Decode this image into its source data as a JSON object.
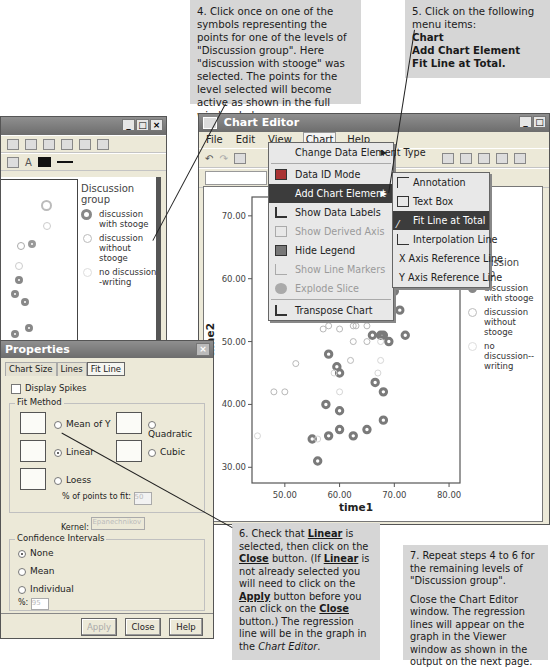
{
  "notes": {
    "step4": "4. Click once on one of the symbols representing the points for one of the levels of \"Discussion group\". Here \"discussion with stooge\" was selected. The points for the level selected will become active as shown in the full window below.",
    "step5_intro": "5. Click on the following menu items:",
    "step5_items": [
      "Chart",
      "Add Chart Element",
      "Fit Line at Total."
    ],
    "step6": {
      "p1": "6. Check that ",
      "linear": "Linear",
      "p2": " is selected, then click on the ",
      "close": "Close",
      "p3": " button. (If ",
      "linear2": "Linear",
      "p4": " is not already selected you will need to click on the ",
      "apply": "Apply",
      "p5": " button before you can click on the ",
      "close2": "Close",
      "p6": " button.) The regression line will be in the graph in the ",
      "editor": "Chart Editor",
      "p7": "."
    },
    "step7_a": "7. Repeat steps 4 to 6 for the remaining levels of \"Discussion group\".",
    "step7_b": "Close the Chart Editor window. The regression lines will appear on the graph in the Viewer window as shown in the output on the next page."
  },
  "bg_window": {
    "buttons": [
      "_",
      "□",
      "×"
    ],
    "legend_title": "Discussion group",
    "legend": [
      "discussion with stooge",
      "discussion without stooge",
      "no discussion--writing"
    ]
  },
  "chart_editor": {
    "title": "Chart Editor",
    "menu": [
      "File",
      "Edit",
      "View",
      "Chart",
      "Help"
    ],
    "active_menu": "Chart",
    "buttons": [
      "_",
      "□"
    ],
    "chart_menu": [
      {
        "label": "Change Data Element Type",
        "submenu": true,
        "state": "normal"
      },
      {
        "label": "Data ID Mode",
        "state": "normal"
      },
      {
        "label": "Add Chart Element",
        "submenu": true,
        "state": "selected"
      },
      {
        "label": "Show Data Labels",
        "state": "normal"
      },
      {
        "label": "Show Derived Axis",
        "state": "disabled"
      },
      {
        "label": "Hide Legend",
        "state": "normal"
      },
      {
        "label": "Show Line Markers",
        "state": "disabled"
      },
      {
        "label": "Explode Slice",
        "state": "disabled"
      },
      {
        "label": "Transpose Chart",
        "state": "normal"
      }
    ],
    "submenu": [
      {
        "label": "Annotation",
        "state": "normal"
      },
      {
        "label": "Text Box",
        "state": "normal"
      },
      {
        "label": "Fit Line at Total",
        "state": "selected"
      },
      {
        "label": "Interpolation Line",
        "state": "normal"
      },
      {
        "label": "X Axis Reference Line",
        "state": "normal"
      },
      {
        "label": "Y Axis Reference Line",
        "state": "normal"
      }
    ],
    "legend_title": "Discussion group",
    "legend": [
      "discussion with stooge",
      "discussion without stooge",
      "no discussion--writing"
    ]
  },
  "chart_data": {
    "type": "scatter",
    "title": "",
    "xlabel": "time1",
    "ylabel": "time2",
    "xlim": [
      44,
      82
    ],
    "ylim": [
      27.5,
      73
    ],
    "xticks": [
      "50.00",
      "60.00",
      "70.00",
      "80.00"
    ],
    "yticks": [
      "30.00",
      "40.00",
      "50.00",
      "60.00",
      "70.00"
    ],
    "legend_title": "Discussion group",
    "legend_placement": "right",
    "series": [
      {
        "name": "discussion with stooge",
        "selected": true,
        "points": [
          [
            70,
            58
          ],
          [
            69,
            56
          ],
          [
            71,
            55
          ],
          [
            66,
            51
          ],
          [
            67.5,
            51
          ],
          [
            68,
            51
          ],
          [
            72,
            51
          ],
          [
            69,
            50
          ],
          [
            58,
            48
          ],
          [
            59.5,
            46
          ],
          [
            60,
            45
          ],
          [
            66.5,
            43.5
          ],
          [
            68,
            42
          ],
          [
            57.5,
            40
          ],
          [
            60,
            39
          ],
          [
            68,
            37.5
          ],
          [
            60,
            36
          ],
          [
            65,
            36
          ],
          [
            55,
            34.5
          ],
          [
            58,
            35
          ],
          [
            62.5,
            35
          ],
          [
            56,
            31
          ]
        ]
      },
      {
        "name": "discussion without stooge",
        "selected": false,
        "points": [
          [
            62,
            58
          ],
          [
            65,
            58
          ],
          [
            62,
            56
          ],
          [
            65,
            56
          ],
          [
            57.5,
            54
          ],
          [
            58,
            54
          ],
          [
            60,
            54
          ],
          [
            58,
            52.5
          ],
          [
            62.5,
            52.5
          ],
          [
            63,
            52.5
          ],
          [
            65,
            52.5
          ],
          [
            60,
            52
          ],
          [
            57,
            52
          ],
          [
            62.5,
            50
          ],
          [
            65,
            50
          ],
          [
            62,
            47
          ],
          [
            52,
            46.5
          ],
          [
            48,
            42
          ],
          [
            50,
            42
          ]
        ]
      },
      {
        "name": "no discussion--writing",
        "selected": false,
        "points": [
          [
            70,
            60
          ],
          [
            65,
            55
          ],
          [
            67.5,
            50
          ],
          [
            67.5,
            47
          ],
          [
            59,
            45
          ],
          [
            67,
            45
          ],
          [
            60,
            42
          ],
          [
            45,
            35
          ],
          [
            56,
            34.5
          ]
        ]
      }
    ]
  },
  "properties": {
    "title": "Properties",
    "tabs": [
      "Chart Size",
      "Lines",
      "Fit Line"
    ],
    "active_tab": "Fit Line",
    "display_spikes": {
      "label": "Display Spikes",
      "checked": false
    },
    "fit_method_label": "Fit Method",
    "fit_methods": [
      {
        "label": "Mean of Y",
        "selected": false
      },
      {
        "label": "Quadratic",
        "selected": false
      },
      {
        "label": "Linear",
        "selected": true
      },
      {
        "label": "Cubic",
        "selected": false
      },
      {
        "label": "Loess",
        "selected": false
      }
    ],
    "points_to_fit_label": "% of points to fit:",
    "points_to_fit_value": "50",
    "kernel_label": "Kernel:",
    "kernel_value": "Epanechnikov",
    "ci_label": "Confidence Intervals",
    "ci_options": [
      {
        "label": "None",
        "selected": true
      },
      {
        "label": "Mean",
        "selected": false
      },
      {
        "label": "Individual",
        "selected": false
      }
    ],
    "percent_label": "%:",
    "percent_value": "95",
    "buttons": [
      "Apply",
      "Close",
      "Help"
    ]
  }
}
